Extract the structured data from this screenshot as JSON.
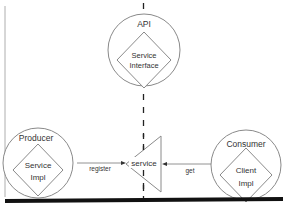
{
  "diagram": {
    "colors": {
      "stroke": "#8a8a8a",
      "text": "#333333",
      "dashed": "#222222",
      "bottom_bar": "#111111",
      "background": "#ffffff"
    },
    "nodes": {
      "api": {
        "title": "API",
        "inner_line1": "Service",
        "inner_line2": "Interface"
      },
      "producer": {
        "title": "Producer",
        "inner_line1": "Service",
        "inner_line2": "Impl"
      },
      "consumer": {
        "title": "Consumer",
        "inner_line1": "Client",
        "inner_line2": "Impl"
      },
      "registry": {
        "label": "service"
      }
    },
    "edges": {
      "register": {
        "label": "register"
      },
      "get": {
        "label": "get"
      }
    }
  }
}
